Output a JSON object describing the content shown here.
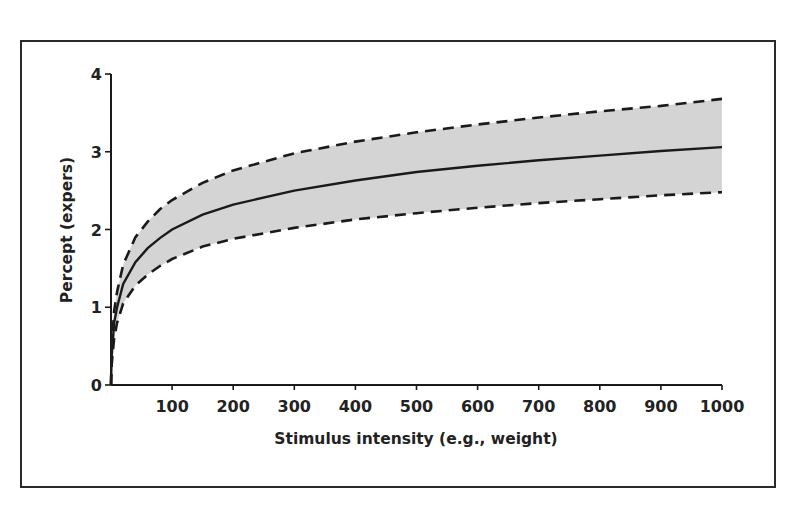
{
  "chart_data": {
    "type": "line",
    "title": "",
    "xlabel": "Stimulus intensity (e.g., weight)",
    "ylabel": "Percept (expers)",
    "xlim": [
      0,
      1000
    ],
    "ylim": [
      0,
      4
    ],
    "x_ticks": [
      100,
      200,
      300,
      400,
      500,
      600,
      700,
      800,
      900,
      1000
    ],
    "y_ticks": [
      0,
      1,
      2,
      3,
      4
    ],
    "grid": false,
    "legend": null,
    "x": [
      1,
      5,
      10,
      20,
      40,
      60,
      80,
      100,
      150,
      200,
      300,
      400,
      500,
      600,
      700,
      800,
      900,
      1000
    ],
    "series": [
      {
        "name": "Mean percept",
        "style": "solid",
        "values": [
          0.35,
          0.8,
          1.0,
          1.3,
          1.58,
          1.76,
          1.89,
          2.0,
          2.19,
          2.32,
          2.5,
          2.63,
          2.74,
          2.82,
          2.89,
          2.95,
          3.01,
          3.06
        ]
      },
      {
        "name": "Upper bound",
        "style": "dashed",
        "values": [
          0.45,
          0.95,
          1.2,
          1.55,
          1.9,
          2.1,
          2.26,
          2.38,
          2.6,
          2.76,
          2.98,
          3.13,
          3.25,
          3.35,
          3.44,
          3.52,
          3.59,
          3.68
        ]
      },
      {
        "name": "Lower bound",
        "style": "dashed",
        "values": [
          0.25,
          0.6,
          0.8,
          1.05,
          1.28,
          1.42,
          1.53,
          1.62,
          1.78,
          1.88,
          2.02,
          2.13,
          2.21,
          2.28,
          2.34,
          2.39,
          2.44,
          2.48
        ]
      }
    ],
    "band": {
      "between": [
        "Lower bound",
        "Upper bound"
      ],
      "fill": "#d4d4d4"
    }
  },
  "colors": {
    "line": "#1a1a1a",
    "band": "#d4d4d4",
    "frame": "#2a2a2a"
  }
}
